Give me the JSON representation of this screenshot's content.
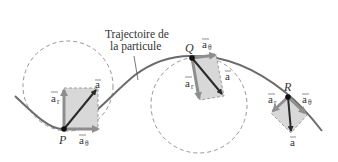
{
  "caption": {
    "line1": "Trajectoire de",
    "line2": "la particule"
  },
  "points": {
    "P": {
      "label": "P",
      "ar": "a",
      "ar_sub": "r",
      "at": "a",
      "at_sub": "θ",
      "a": "a"
    },
    "Q": {
      "label": "Q",
      "ar": "a",
      "ar_sub": "r",
      "at": "a",
      "at_sub": "θ",
      "a": "a"
    },
    "R": {
      "label": "R",
      "ar": "a",
      "ar_sub": "r",
      "at": "a",
      "at_sub": "θ",
      "a": "a"
    }
  },
  "colors": {
    "curve": "#6b6b6b",
    "total_accel": "#2a2a2a",
    "component": "#8e8e8e",
    "box_fill": "#d8d8d8",
    "dashed": "#8a8a8a"
  }
}
